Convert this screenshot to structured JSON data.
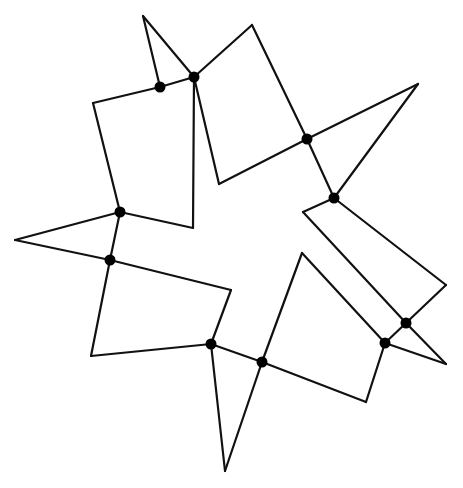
{
  "figure": {
    "line_color": "#111111",
    "dot_color": "#000000",
    "background": "#ffffff"
  },
  "vertices": {
    "top_tip": [
      143,
      16
    ],
    "A": [
      160,
      87
    ],
    "B": [
      194,
      77
    ],
    "top_right_corner": [
      252,
      25
    ],
    "C": [
      307,
      139
    ],
    "right_tip": [
      418,
      84
    ],
    "D": [
      334,
      198
    ],
    "notch_upper": [
      219,
      184
    ],
    "right_quad_left": [
      303,
      212
    ],
    "right_quad_right": [
      446,
      285
    ],
    "E": [
      406,
      323
    ],
    "F": [
      385,
      343
    ],
    "bottom_right_tip": [
      446,
      364
    ],
    "notch_right": [
      302,
      253
    ],
    "bottom_right_corner": [
      366,
      402
    ],
    "G": [
      262,
      362
    ],
    "bottom_tip": [
      225,
      471
    ],
    "H": [
      211,
      344
    ],
    "bottom_left_corner": [
      91,
      356
    ],
    "notch_lower": [
      231,
      290
    ],
    "I": [
      110,
      260
    ],
    "left_tip": [
      15,
      240
    ],
    "J": [
      120,
      212
    ],
    "left_quad_corner": [
      93,
      103
    ],
    "notch_left": [
      193,
      228
    ]
  },
  "edges": [
    [
      "top_tip",
      "A"
    ],
    [
      "top_tip",
      "B"
    ],
    [
      "A",
      "B"
    ],
    [
      "B",
      "top_right_corner"
    ],
    [
      "top_right_corner",
      "C"
    ],
    [
      "B",
      "notch_left"
    ],
    [
      "A",
      "left_quad_corner"
    ],
    [
      "left_quad_corner",
      "J"
    ],
    [
      "J",
      "notch_left"
    ],
    [
      "C",
      "right_tip"
    ],
    [
      "right_tip",
      "D"
    ],
    [
      "C",
      "D"
    ],
    [
      "C",
      "notch_upper"
    ],
    [
      "notch_upper",
      "B"
    ],
    [
      "D",
      "right_quad_left"
    ],
    [
      "right_quad_left",
      "E"
    ],
    [
      "D",
      "right_quad_right"
    ],
    [
      "right_quad_right",
      "E"
    ],
    [
      "E",
      "F"
    ],
    [
      "E",
      "bottom_right_tip"
    ],
    [
      "F",
      "bottom_right_tip"
    ],
    [
      "notch_right",
      "F"
    ],
    [
      "notch_right",
      "G"
    ],
    [
      "F",
      "bottom_right_corner"
    ],
    [
      "bottom_right_corner",
      "G"
    ],
    [
      "G",
      "bottom_tip"
    ],
    [
      "bottom_tip",
      "H"
    ],
    [
      "G",
      "H"
    ],
    [
      "H",
      "notch_lower"
    ],
    [
      "notch_lower",
      "I"
    ],
    [
      "H",
      "bottom_left_corner"
    ],
    [
      "bottom_left_corner",
      "I"
    ],
    [
      "I",
      "left_tip"
    ],
    [
      "left_tip",
      "J"
    ],
    [
      "I",
      "J"
    ]
  ],
  "dots": [
    "A",
    "B",
    "C",
    "D",
    "E",
    "F",
    "G",
    "H",
    "I",
    "J"
  ]
}
